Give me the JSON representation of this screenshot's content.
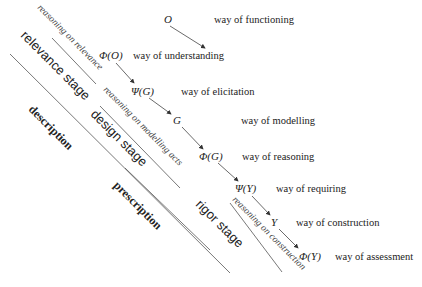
{
  "nodes": [
    {
      "label": "O",
      "x": 164,
      "y": 23,
      "way": "way of functioning",
      "wx": 214
    },
    {
      "label": "Φ(O)",
      "x": 99,
      "y": 59,
      "way": "way of understanding",
      "wx": 133
    },
    {
      "label": "Ψ(G)",
      "x": 131,
      "y": 95,
      "way": "way of elicitation",
      "wx": 181
    },
    {
      "label": "G",
      "x": 173,
      "y": 124,
      "way": "way of modelling",
      "wx": 241
    },
    {
      "label": "Φ(G)",
      "x": 199,
      "y": 160,
      "way": "way of reasoning",
      "wx": 242
    },
    {
      "label": "Ψ(Y)",
      "x": 235,
      "y": 192,
      "way": "way of requiring",
      "wx": 276
    },
    {
      "label": "Y",
      "x": 271,
      "y": 226,
      "way": "way of construction",
      "wx": 296
    },
    {
      "label": "Φ(Y)",
      "x": 299,
      "y": 260,
      "way": "way of assessment",
      "wx": 335
    }
  ],
  "reasoning_labels": [
    {
      "text": "reasoning on relevance",
      "x": 37,
      "y": 8
    },
    {
      "text": "reasoning on modelling acts",
      "x": 103,
      "y": 90
    },
    {
      "text": "reasoning on construction",
      "x": 232,
      "y": 200
    }
  ],
  "stage_labels": [
    {
      "text": "relevance stage",
      "x": 20,
      "y": 36
    },
    {
      "text": "design stage",
      "x": 90,
      "y": 115
    },
    {
      "text": "rigor stage",
      "x": 195,
      "y": 205
    }
  ],
  "phase_labels": [
    {
      "text": "description",
      "x": 28,
      "y": 110
    },
    {
      "text": "prescription",
      "x": 113,
      "y": 186
    }
  ],
  "lines": [
    {
      "x1": 10,
      "y1": 54,
      "x2": 230,
      "y2": 273
    },
    {
      "x1": 52,
      "y1": 38,
      "x2": 96,
      "y2": 84
    },
    {
      "x1": 100,
      "y1": 106,
      "x2": 180,
      "y2": 188
    },
    {
      "x1": 125,
      "y1": 168,
      "x2": 210,
      "y2": 250
    },
    {
      "x1": 230,
      "y1": 203,
      "x2": 282,
      "y2": 272
    }
  ],
  "arrows": [
    {
      "x1": 170,
      "y1": 26,
      "x2": 205,
      "y2": 48
    },
    {
      "x1": 116,
      "y1": 63,
      "x2": 134,
      "y2": 83
    },
    {
      "x1": 149,
      "y1": 98,
      "x2": 171,
      "y2": 114
    },
    {
      "x1": 182,
      "y1": 127,
      "x2": 203,
      "y2": 149
    },
    {
      "x1": 218,
      "y1": 163,
      "x2": 238,
      "y2": 181
    },
    {
      "x1": 252,
      "y1": 196,
      "x2": 270,
      "y2": 215
    },
    {
      "x1": 279,
      "y1": 229,
      "x2": 298,
      "y2": 248
    }
  ]
}
